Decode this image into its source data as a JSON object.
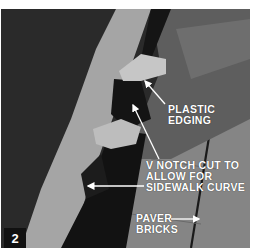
{
  "figure": {
    "step_number": "2",
    "labels": {
      "plastic_edging": [
        "PLASTIC",
        "EDGING"
      ],
      "v_notch": [
        "V NOTCH CUT TO",
        "ALLOW FOR",
        "SIDEWALK CURVE"
      ],
      "paver_bricks": [
        "PAVER",
        "BRICKS"
      ]
    },
    "colors": {
      "background": "#ffffff",
      "soil": "#2a2a2a",
      "sand": "#a8a8a8",
      "edging": "#141414",
      "sleeve": "#5e5e5e",
      "pavers": "#858585",
      "hand": "#c9c9c9",
      "label_text": "#ffffff",
      "step_box": "#111111"
    }
  }
}
